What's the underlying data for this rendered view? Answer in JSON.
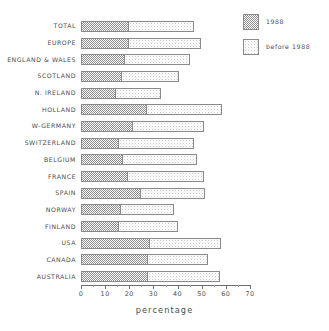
{
  "chart_data": {
    "type": "bar",
    "orientation": "horizontal",
    "stacked": true,
    "title": "",
    "xlabel": "percentage",
    "ylabel": "",
    "xlim": [
      0,
      70
    ],
    "xticks": [
      0,
      10,
      20,
      30,
      40,
      50,
      60,
      70
    ],
    "xtick_labels": [
      "0",
      "10",
      "20",
      "30",
      "40",
      "50",
      "60",
      "70"
    ],
    "minor_tick_step": 5,
    "grid": false,
    "legend_position": "top-right",
    "categories": [
      "TOTAL",
      "EUROPE",
      "ENGLAND & WALES",
      "SCOTLAND",
      "N. IRELAND",
      "HOLLAND",
      "W-GERMANY",
      "SWITZERLAND",
      "BELGIUM",
      "FRANCE",
      "SPAIN",
      "NORWAY",
      "FINLAND",
      "USA",
      "CANADA",
      "AUSTRALIA"
    ],
    "series": [
      {
        "name": "1988",
        "color": "#8d8d8d",
        "pattern": "dense-checker",
        "values": [
          19.5,
          19.5,
          18.0,
          16.5,
          14.0,
          27.0,
          21.0,
          15.5,
          17.0,
          19.0,
          24.5,
          16.0,
          15.5,
          28.0,
          27.5,
          27.5
        ]
      },
      {
        "name": "before 1988",
        "color": "#e8e8e8",
        "pattern": "sparse-dither",
        "values": [
          27.5,
          30.0,
          27.0,
          24.0,
          19.0,
          31.5,
          30.0,
          31.5,
          31.0,
          32.0,
          27.0,
          22.5,
          24.5,
          30.0,
          25.0,
          30.0
        ]
      }
    ],
    "totals": [
      47.0,
      49.5,
      45.0,
      40.5,
      33.0,
      58.5,
      51.0,
      47.0,
      48.0,
      51.0,
      51.5,
      38.5,
      40.0,
      58.0,
      52.5,
      57.5
    ]
  },
  "legend": {
    "items": [
      {
        "label": "1988"
      },
      {
        "label": "before 1988"
      }
    ]
  },
  "colors": {
    "axis": "#6e6e6e",
    "text": "#4d4d4d",
    "bar_border": "#8a8a8a",
    "series_1988": "#8d8d8d",
    "series_before_1988": "#e8e8e8",
    "background": "#ffffff"
  }
}
